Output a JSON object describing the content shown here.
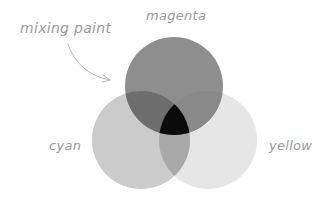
{
  "annotation": {
    "text": "mixing paint"
  },
  "circles": [
    {
      "name": "magenta",
      "label": "magenta",
      "cx": 174,
      "cy": 86,
      "r": 49,
      "fill": "#8c8c8c",
      "opacity": 0.95
    },
    {
      "name": "cyan",
      "label": "cyan",
      "cx": 141,
      "cy": 140,
      "r": 49,
      "fill": "#c8c8c8",
      "opacity": 0.85
    },
    {
      "name": "yellow",
      "label": "yellow",
      "cx": 208,
      "cy": 140,
      "r": 49,
      "fill": "#e4e4e4",
      "opacity": 0.85
    }
  ],
  "overlaps": {
    "magenta_cyan": "#6e6e6e",
    "magenta_yellow": "#8a8a8a",
    "cyan_yellow": "#a8a8a8",
    "all": "#0a0a0a"
  },
  "text_color": "#9a9a9a"
}
